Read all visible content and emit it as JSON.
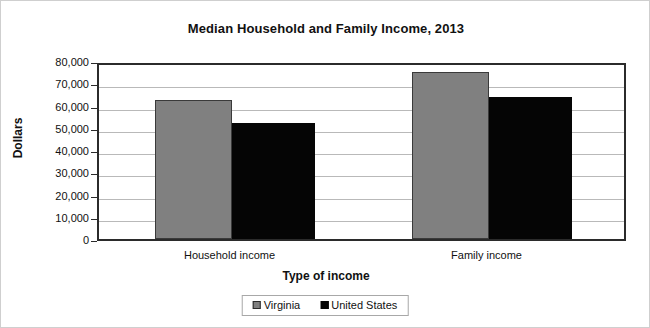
{
  "chart_data": {
    "type": "bar",
    "title": "Median Household and Family Income, 2013",
    "xlabel": "Type of income",
    "ylabel": "Dollars",
    "categories": [
      "Household income",
      "Family income"
    ],
    "series": [
      {
        "name": "Virginia",
        "color": "#808080",
        "values": [
          62500,
          75000
        ]
      },
      {
        "name": "United States",
        "color": "#050505",
        "values": [
          52250,
          64000
        ]
      }
    ],
    "ylim": [
      0,
      80000
    ],
    "ytick_values": [
      80000,
      70000,
      60000,
      50000,
      40000,
      30000,
      20000,
      10000,
      0
    ],
    "ytick_labels": [
      "80,000",
      "70,000",
      "60,000",
      "50,000",
      "40,000",
      "30,000",
      "20,000",
      "10,000",
      "0"
    ],
    "grid": true,
    "legend_position": "bottom"
  },
  "legend": {
    "entries": [
      {
        "label": "Virginia",
        "swatch": "gray-square-icon"
      },
      {
        "label": "United States",
        "swatch": "black-square-icon"
      }
    ]
  }
}
